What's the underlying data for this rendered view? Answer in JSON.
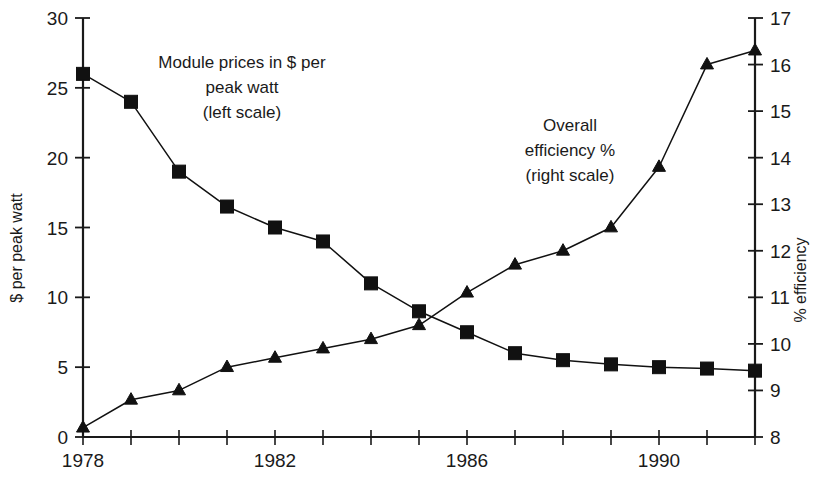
{
  "chart_data": {
    "type": "line",
    "title": "",
    "subtitle": "",
    "xlabel": "",
    "ylabel": "$ per peak watt",
    "y2label": "% efficiency",
    "x": [
      1978,
      1979,
      1980,
      1981,
      1982,
      1983,
      1984,
      1985,
      1986,
      1987,
      1988,
      1989,
      1990,
      1991,
      1992
    ],
    "xlim": [
      1978,
      1992
    ],
    "ylim": [
      0,
      30
    ],
    "y2lim": [
      8,
      17
    ],
    "xticks": [
      1978,
      1979,
      1980,
      1981,
      1982,
      1983,
      1984,
      1985,
      1986,
      1987,
      1988,
      1989,
      1990,
      1991,
      1992
    ],
    "xtick_labels": [
      "1978",
      "",
      "",
      "",
      "1982",
      "",
      "",
      "",
      "1986",
      "",
      "",
      "",
      "1990",
      "",
      ""
    ],
    "yticks": [
      0,
      5,
      10,
      15,
      20,
      25,
      30
    ],
    "ytick_labels": [
      "0",
      "5",
      "10",
      "15",
      "20",
      "25",
      "30"
    ],
    "y2ticks": [
      8,
      9,
      10,
      11,
      12,
      13,
      14,
      15,
      16,
      17
    ],
    "y2tick_labels": [
      "8",
      "9",
      "10",
      "11",
      "12",
      "13",
      "14",
      "15",
      "16",
      "17"
    ],
    "grid": false,
    "legend": "inline-annotations",
    "series": [
      {
        "name": "Module prices in $ per peak watt",
        "axis": "left",
        "marker": "square",
        "color": "#111111",
        "values": [
          26.0,
          24.0,
          19.0,
          16.5,
          15.0,
          14.0,
          11.0,
          9.0,
          7.5,
          6.0,
          5.5,
          5.2,
          5.0,
          4.9,
          4.75
        ]
      },
      {
        "name": "Overall efficiency %",
        "axis": "right",
        "marker": "triangle",
        "color": "#111111",
        "values": [
          8.2,
          8.8,
          9.0,
          9.5,
          9.7,
          9.9,
          10.1,
          10.4,
          11.1,
          11.7,
          12.0,
          12.5,
          13.8,
          16.0,
          16.3
        ]
      }
    ],
    "annotations": [
      {
        "id": "left-series-label",
        "lines": [
          "Module prices in $ per",
          "peak watt",
          "(left scale)"
        ],
        "x": 242,
        "y": 68,
        "align": "middle"
      },
      {
        "id": "right-series-label",
        "lines": [
          "Overall",
          "efficiency %",
          "(right scale)"
        ],
        "x": 570,
        "y": 131,
        "align": "middle"
      }
    ]
  }
}
